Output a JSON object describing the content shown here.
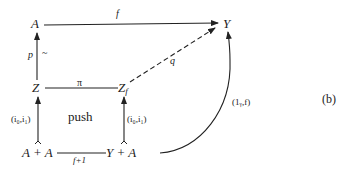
{
  "diagram": {
    "label": "(b)",
    "nodes": {
      "A": "A",
      "Y": "Y",
      "Z": "Z",
      "Zf_base": "Z",
      "Zf_sub": "f",
      "AplusA": "A + A",
      "YplusA": "Y + A"
    },
    "arrows": {
      "f": "f",
      "p": "p",
      "tilde": "~",
      "pi": "π",
      "q": "q",
      "i_left": "(i₀,i₁)",
      "i_right": "(i₀,i₁)",
      "f_plus_1": "f+1",
      "one_y_f": "(1ᵧ,f)"
    },
    "center_label": "push",
    "colors": {
      "ink": "#222222",
      "background": "#ffffff"
    }
  }
}
